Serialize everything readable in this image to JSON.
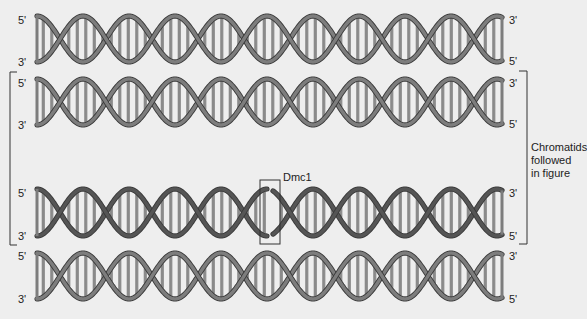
{
  "diagram": {
    "helices": [
      {
        "id": "h1",
        "left_label_top": "5'",
        "left_label_bottom": "3'",
        "right_label_top": "3'",
        "right_label_bottom": "5'",
        "followed": false,
        "break": false
      },
      {
        "id": "h2",
        "left_label_top": "5'",
        "left_label_bottom": "3'",
        "right_label_top": "3'",
        "right_label_bottom": "5'",
        "followed": true,
        "break": false
      },
      {
        "id": "h3",
        "left_label_top": "5'",
        "left_label_bottom": "3'",
        "right_label_top": "3'",
        "right_label_bottom": "5'",
        "followed": true,
        "break": true
      },
      {
        "id": "h4",
        "left_label_top": "5'",
        "left_label_bottom": "3'",
        "right_label_top": "3'",
        "right_label_bottom": "5'",
        "followed": false,
        "break": false
      }
    ],
    "break_annotation": {
      "label": "Dmc1"
    },
    "bracket_note": [
      "Chromatids",
      "followed",
      "in figure"
    ],
    "colors": {
      "background": "#eeeeee",
      "strand": "#7d7d7d",
      "strand_dark": "#555555",
      "strand_edge": "#3a3a3a",
      "rung": "#8a8a8a",
      "bracket": "#333333"
    }
  }
}
